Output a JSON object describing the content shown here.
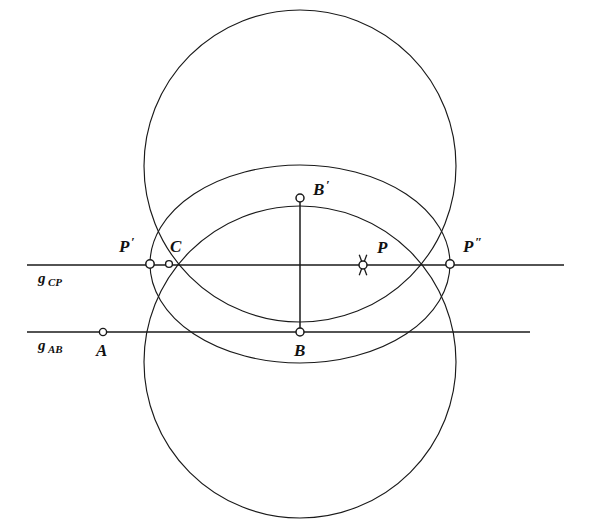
{
  "figure": {
    "background_color": "#ffffff",
    "ink_color": "#1a1a1a",
    "width": 593,
    "height": 524
  },
  "lines": [
    {
      "id": "g_CP",
      "label_base": "g",
      "label_sub": "CP",
      "label_x": 38,
      "label_sub_x": 48,
      "label_y": 283,
      "y": 265,
      "x1": 27,
      "x2": 564
    },
    {
      "id": "g_AB",
      "label_base": "g",
      "label_sub": "AB",
      "label_x": 38,
      "label_sub_x": 48,
      "label_y": 350,
      "y": 332,
      "x1": 27,
      "x2": 530
    }
  ],
  "segments": [
    {
      "id": "BB-prime",
      "x1": 300,
      "y1": 198,
      "x2": 300,
      "y2": 332
    }
  ],
  "circles": [
    {
      "id": "upper-circle",
      "cx": 300,
      "cy": 166,
      "r": 156
    },
    {
      "id": "lower-circle",
      "cx": 300,
      "cy": 362,
      "r": 156
    }
  ],
  "ellipses": [
    {
      "id": "main-ellipse",
      "cx": 300,
      "cy": 264,
      "rx": 150,
      "ry": 99
    }
  ],
  "points": [
    {
      "id": "P-prime",
      "label": "P",
      "prime": "′",
      "x": 150,
      "y": 264,
      "radius": 4.2,
      "label_x": 119,
      "label_y": 252,
      "prime_x": 131,
      "prime_y": 246,
      "marked": false
    },
    {
      "id": "C",
      "label": "C",
      "prime": "",
      "x": 169,
      "y": 264,
      "radius": 3.4,
      "label_x": 170,
      "label_y": 252,
      "prime_x": 0,
      "prime_y": 0,
      "marked": false
    },
    {
      "id": "P",
      "label": "P",
      "prime": "",
      "x": 363,
      "y": 265,
      "radius": 4.0,
      "label_x": 377,
      "label_y": 253,
      "prime_x": 0,
      "prime_y": 0,
      "marked": true
    },
    {
      "id": "P-double-prime",
      "label": "P",
      "prime": "″",
      "x": 450,
      "y": 264,
      "radius": 4.2,
      "label_x": 463,
      "label_y": 252,
      "prime_x": 475,
      "prime_y": 246,
      "marked": false
    },
    {
      "id": "B-prime",
      "label": "B",
      "prime": "′",
      "x": 300,
      "y": 198,
      "radius": 4.0,
      "label_x": 313,
      "label_y": 195,
      "prime_x": 326,
      "prime_y": 189,
      "marked": false
    },
    {
      "id": "B",
      "label": "B",
      "prime": "",
      "x": 300,
      "y": 332,
      "radius": 4.0,
      "label_x": 294,
      "label_y": 356,
      "prime_x": 0,
      "prime_y": 0,
      "marked": false
    },
    {
      "id": "A",
      "label": "A",
      "prime": "",
      "x": 103,
      "y": 332,
      "radius": 3.6,
      "label_x": 96,
      "label_y": 356,
      "prime_x": 0,
      "prime_y": 0,
      "marked": false
    }
  ],
  "cross_mark": {
    "id": "P-cross",
    "cx": 363,
    "cy": 265,
    "arm": 11,
    "angle_deg": 70
  }
}
